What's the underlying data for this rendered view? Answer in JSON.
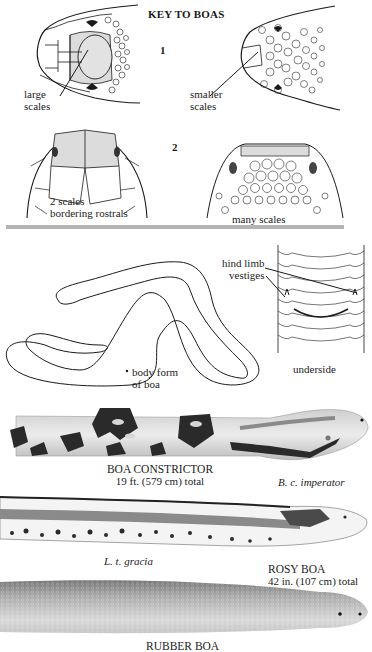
{
  "page": {
    "title": "KEY TO BOAS",
    "key1": {
      "number": "1",
      "left_label": [
        "large",
        "scales"
      ],
      "right_label": [
        "smaller",
        "scales"
      ]
    },
    "key2": {
      "number": "2",
      "left_label": [
        "2 scales",
        "bordering rostrals"
      ],
      "right_label": "many scales"
    },
    "body": {
      "form_label": [
        "body  form",
        "of boa"
      ],
      "vestige_label": [
        "hind limb",
        "vestiges"
      ],
      "underside_label": "underside"
    },
    "species": [
      {
        "name": "BOA CONSTRICTOR",
        "size": "19 ft. (579 cm) total",
        "subspecies": "B. c. imperator"
      },
      {
        "name": "ROSY BOA",
        "size": "42 in. (107 cm) total",
        "subspecies": "L. t. gracia"
      },
      {
        "name": "RUBBER BOA",
        "size": "",
        "subspecies": ""
      }
    ],
    "colors": {
      "highlight_scale": "#dcdcdc",
      "divider": "#b4b4b4",
      "ink": "#1a1a1a"
    }
  }
}
